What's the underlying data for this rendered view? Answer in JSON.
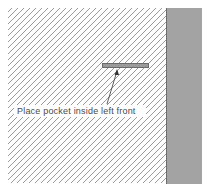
{
  "diagram": {
    "type": "sewing-instruction",
    "label": "Place pocket inside left front",
    "parts": {
      "fabric": {
        "name": "left front",
        "pattern": "diagonal-hatch",
        "color": "#9a9a9a"
      },
      "facing": {
        "name": "facing",
        "color": "#a3a3a3"
      },
      "pocket": {
        "name": "pocket",
        "color": "#9a9a9a"
      }
    },
    "arrow": {
      "from": "label",
      "to": "pocket"
    }
  }
}
